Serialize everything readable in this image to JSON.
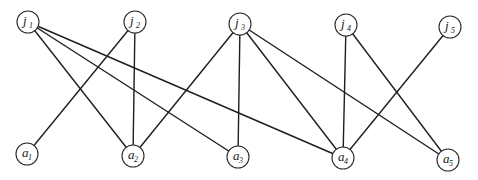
{
  "diagram": {
    "type": "bipartite-graph",
    "radius": 11,
    "stroke_color": "#1e1e1e",
    "top_nodes": [
      {
        "id": "j1",
        "base": "j",
        "sub": "1",
        "x": 28,
        "y": 22
      },
      {
        "id": "j2",
        "base": "j",
        "sub": "2",
        "x": 135,
        "y": 22
      },
      {
        "id": "j3",
        "base": "j",
        "sub": "3",
        "x": 240,
        "y": 24
      },
      {
        "id": "j4",
        "base": "j",
        "sub": "4",
        "x": 346,
        "y": 25
      },
      {
        "id": "j5",
        "base": "j",
        "sub": "5",
        "x": 450,
        "y": 27
      }
    ],
    "bottom_nodes": [
      {
        "id": "a1",
        "base": "a",
        "sub": "1",
        "x": 27,
        "y": 154
      },
      {
        "id": "a2",
        "base": "a",
        "sub": "2",
        "x": 133,
        "y": 156
      },
      {
        "id": "a3",
        "base": "a",
        "sub": "3",
        "x": 238,
        "y": 157
      },
      {
        "id": "a4",
        "base": "a",
        "sub": "4",
        "x": 343,
        "y": 158
      },
      {
        "id": "a5",
        "base": "a",
        "sub": "5",
        "x": 448,
        "y": 160
      }
    ],
    "edges": [
      [
        "j1",
        "a2"
      ],
      [
        "j1",
        "a3"
      ],
      [
        "j1",
        "a4"
      ],
      [
        "j2",
        "a1"
      ],
      [
        "j2",
        "a2"
      ],
      [
        "j3",
        "a2"
      ],
      [
        "j3",
        "a3"
      ],
      [
        "j3",
        "a4"
      ],
      [
        "j3",
        "a5"
      ],
      [
        "j4",
        "a4"
      ],
      [
        "j4",
        "a5"
      ],
      [
        "j5",
        "a4"
      ]
    ]
  }
}
